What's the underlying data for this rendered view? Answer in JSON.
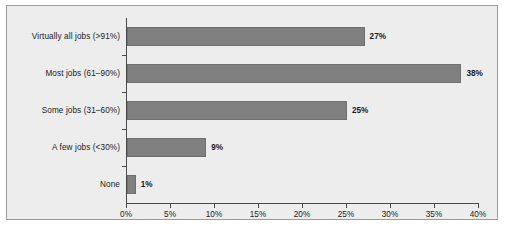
{
  "chart_data": {
    "type": "bar",
    "orientation": "horizontal",
    "title": "",
    "xlabel": "",
    "ylabel": "",
    "categories": [
      "Virtually all jobs (>91%)",
      "Most jobs (61–90%)",
      "Some jobs (31–60%)",
      "A few jobs (<30%)",
      "None"
    ],
    "values": [
      27,
      38,
      25,
      9,
      1
    ],
    "value_labels": [
      "27%",
      "38%",
      "25%",
      "9%",
      "1%"
    ],
    "xlim": [
      0,
      40
    ],
    "xticks": [
      0,
      5,
      10,
      15,
      20,
      25,
      30,
      35,
      40
    ],
    "xtick_labels": [
      "0%",
      "5%",
      "10%",
      "15%",
      "20%",
      "25%",
      "30%",
      "35%",
      "40%"
    ],
    "grid": false,
    "legend": null,
    "bar_color": "#808080",
    "plot_background": "#ededed",
    "border_color": "#9a9a9a",
    "axis_color": "#4a4a4a",
    "text_color": "#1a1a1a"
  },
  "artifact": {
    "overlay_text": "— —— ——— —— ———— ——"
  }
}
